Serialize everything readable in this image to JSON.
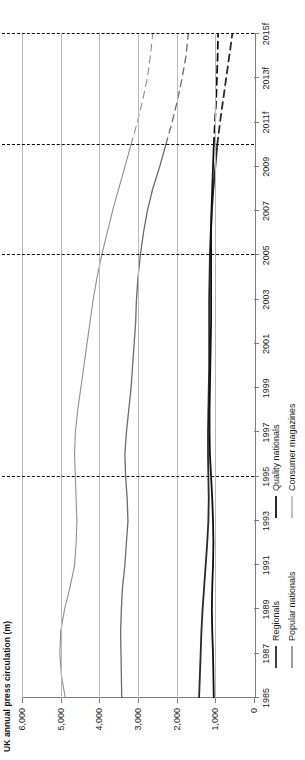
{
  "title": "UK annual press circulation (m)",
  "chart_data": {
    "type": "line",
    "title": "UK annual press circulation (m)",
    "xlabel": "",
    "ylabel": "",
    "ylim": [
      0,
      6000
    ],
    "ytick_labels": [
      "0",
      "1,000",
      "2,000",
      "3,000",
      "4,000",
      "5,000",
      "6,000"
    ],
    "ytick_values": [
      0,
      1000,
      2000,
      3000,
      4000,
      5000,
      6000
    ],
    "grid": true,
    "legend_position": "bottom",
    "xlim": [
      1985,
      2015
    ],
    "x": [
      1985,
      1986,
      1987,
      1988,
      1989,
      1990,
      1991,
      1992,
      1993,
      1994,
      1995,
      1996,
      1997,
      1998,
      1999,
      2000,
      2001,
      2002,
      2003,
      2004,
      2005,
      2006,
      2007,
      2008,
      2009,
      2010,
      2011,
      2012,
      2013,
      2014,
      2015
    ],
    "xtick_labels": [
      "1985",
      "1987",
      "1989",
      "1991",
      "1993",
      "1995",
      "1997",
      "1999",
      "2001",
      "2003",
      "2005",
      "2007",
      "2009",
      "2011f",
      "2013f",
      "2015f"
    ],
    "xtick_values": [
      1985,
      1987,
      1989,
      1991,
      1993,
      1995,
      1997,
      1999,
      2001,
      2003,
      2005,
      2007,
      2009,
      2011,
      2013,
      2015
    ],
    "forecast_start": 2010,
    "series": [
      {
        "name": "Consumer magazines",
        "color": "#8e8e8e",
        "width": 1.1,
        "values": [
          4880,
          4980,
          5020,
          5000,
          4900,
          4760,
          4640,
          4600,
          4580,
          4600,
          4620,
          4640,
          4620,
          4560,
          4480,
          4400,
          4320,
          4240,
          4160,
          4060,
          3940,
          3800,
          3660,
          3500,
          3340,
          3180,
          3020,
          2880,
          2760,
          2680,
          2620
        ]
      },
      {
        "name": "Popular nationals",
        "color": "#6b6b6b",
        "width": 1.3,
        "values": [
          3420,
          3430,
          3440,
          3450,
          3430,
          3400,
          3340,
          3300,
          3260,
          3280,
          3320,
          3340,
          3300,
          3240,
          3180,
          3140,
          3100,
          3060,
          3040,
          3000,
          2940,
          2860,
          2760,
          2620,
          2440,
          2280,
          2120,
          1980,
          1860,
          1760,
          1700
        ]
      },
      {
        "name": "Regionals",
        "color": "#2a2a2a",
        "width": 1.8,
        "values": [
          1420,
          1400,
          1380,
          1360,
          1330,
          1290,
          1250,
          1210,
          1180,
          1170,
          1180,
          1190,
          1190,
          1180,
          1170,
          1160,
          1160,
          1160,
          1160,
          1150,
          1140,
          1120,
          1090,
          1050,
          1000,
          950,
          880,
          800,
          720,
          640,
          560
        ]
      },
      {
        "name": "Quality nationals",
        "color": "#111111",
        "width": 1.8,
        "values": [
          1040,
          1050,
          1060,
          1080,
          1090,
          1080,
          1060,
          1050,
          1060,
          1080,
          1110,
          1140,
          1150,
          1150,
          1140,
          1130,
          1120,
          1110,
          1110,
          1110,
          1110,
          1110,
          1100,
          1080,
          1060,
          1040,
          1010,
          980,
          960,
          940,
          930
        ]
      }
    ],
    "annotations": [
      {
        "x": 1995,
        "label": "UK dial-up\ninternet\nlaunches",
        "style": "dashed"
      },
      {
        "x": 2005,
        "label": "34%\nbroadband\nhousehold\n(HH)\npenetration",
        "style": "dashed"
      },
      {
        "x": 2010,
        "label": "68%\nbroadband\nHH; mobile\ninternet\ntakes off",
        "style": "dashed"
      },
      {
        "x": 2015,
        "label": "75%\nsmartphone\npenetration",
        "style": "dashed"
      }
    ]
  },
  "legend": {
    "columns": [
      {
        "items": [
          "Regionals",
          "Popular nationals"
        ]
      },
      {
        "items": [
          "Quality nationals",
          "Consumer magazines"
        ]
      }
    ]
  }
}
